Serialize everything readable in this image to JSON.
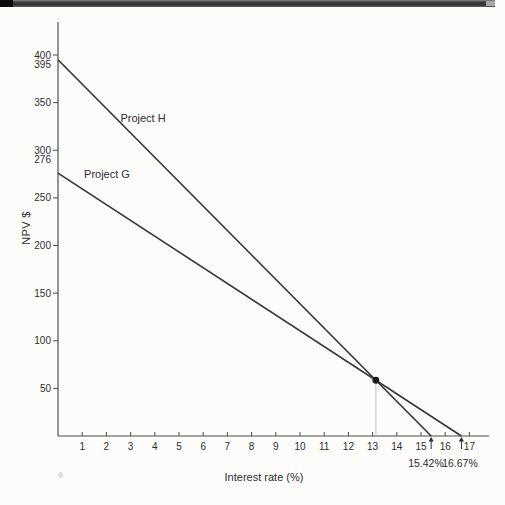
{
  "header": {
    "style": "scanned-page-top-bar"
  },
  "chart_data": {
    "type": "line",
    "title": "",
    "xlabel": "Interest rate (%)",
    "ylabel": "NPV $",
    "xlim": [
      0,
      17.8
    ],
    "ylim": [
      0,
      435
    ],
    "x_ticks": [
      1,
      2,
      3,
      4,
      5,
      6,
      7,
      8,
      9,
      10,
      11,
      12,
      13,
      14,
      15,
      16,
      17
    ],
    "y_ticks": [
      50,
      100,
      150,
      200,
      250,
      300,
      350,
      400
    ],
    "extra_y_axis_labels": [
      {
        "label": "395",
        "value": 395
      },
      {
        "label": "276",
        "value": 276
      }
    ],
    "series": [
      {
        "name": "Project H",
        "points": [
          [
            0,
            395
          ],
          [
            15.42,
            0
          ]
        ]
      },
      {
        "name": "Project G",
        "points": [
          [
            0,
            276
          ],
          [
            16.67,
            0
          ]
        ]
      }
    ],
    "crossover_point": {
      "rate": 13.1,
      "npv": 58.5,
      "marker": "filled-dot",
      "dropline_to_axis": true
    },
    "irr_annotations": [
      {
        "label": "15.42%",
        "rate": 15.42,
        "arrow": "up"
      },
      {
        "label": "16.67%",
        "rate": 16.67,
        "arrow": "up"
      }
    ],
    "grid": false,
    "legend_position": "inline-on-lines",
    "colors": {
      "line": "#383838",
      "axis": "#4d4d4d",
      "text": "#2e2e2e",
      "dropline": "#c4c4c4",
      "marker": "#1c1c1c"
    }
  }
}
